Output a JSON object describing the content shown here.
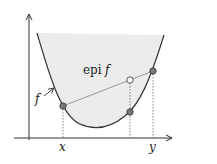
{
  "diagram": {
    "labels": {
      "epi": "epi",
      "f_in_epi": "f",
      "f_curve": "f",
      "x_tick": "x",
      "y_tick": "y"
    },
    "colors": {
      "curve": "#333333",
      "fill": "#ececec",
      "chord": "#999999",
      "point": "#777777"
    }
  }
}
